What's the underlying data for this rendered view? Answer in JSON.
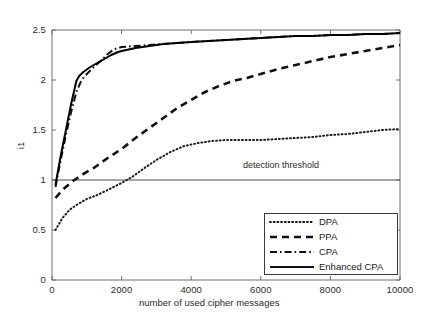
{
  "chart_data": {
    "type": "line",
    "title": "",
    "xlabel": "number of used cipher messages",
    "ylabel": "i1",
    "xlim": [
      0,
      10000
    ],
    "ylim": [
      0,
      2.5
    ],
    "xticks": [
      0,
      2000,
      4000,
      6000,
      8000,
      10000
    ],
    "xtick_labels": [
      "0",
      "2000",
      "4000",
      "6000",
      "8000",
      "10000"
    ],
    "yticks": [
      0,
      0.5,
      1,
      1.5,
      2,
      2.5
    ],
    "ytick_labels": [
      "0",
      "0.5",
      "1",
      "1.5",
      "2",
      "2.5"
    ],
    "grid": false,
    "legend_position": "lower right",
    "annotations": [
      {
        "text": "detection threshold",
        "x": 7600,
        "y": 1.13
      }
    ],
    "threshold_line": {
      "label": "detection threshold",
      "y": 1.0,
      "style": "solid",
      "color": "#4d4d4d"
    },
    "series": [
      {
        "name": "DPA",
        "style": "dotted",
        "color": "#1a1a1a",
        "x": [
          100,
          300,
          500,
          700,
          1000,
          1300,
          1600,
          2000,
          2300,
          2700,
          3000,
          3400,
          3800,
          4200,
          4600,
          5000,
          5500,
          6000,
          6500,
          7000,
          7500,
          8000,
          8500,
          9000,
          9500,
          10000
        ],
        "y": [
          0.5,
          0.62,
          0.7,
          0.75,
          0.81,
          0.85,
          0.9,
          0.97,
          1.03,
          1.13,
          1.2,
          1.28,
          1.34,
          1.37,
          1.39,
          1.4,
          1.4,
          1.4,
          1.41,
          1.42,
          1.43,
          1.45,
          1.46,
          1.48,
          1.5,
          1.51
        ]
      },
      {
        "name": "PPA",
        "style": "dashed",
        "color": "#111111",
        "x": [
          100,
          300,
          600,
          900,
          1200,
          1600,
          2000,
          2400,
          2800,
          3200,
          3600,
          4000,
          4400,
          4800,
          5200,
          5600,
          6000,
          6500,
          7000,
          7500,
          8000,
          8500,
          9000,
          9500,
          10000
        ],
        "y": [
          0.82,
          0.9,
          0.99,
          1.06,
          1.12,
          1.22,
          1.31,
          1.42,
          1.52,
          1.62,
          1.72,
          1.8,
          1.88,
          1.94,
          1.99,
          2.02,
          2.06,
          2.11,
          2.15,
          2.19,
          2.23,
          2.26,
          2.29,
          2.32,
          2.35
        ]
      },
      {
        "name": "CPA",
        "style": "dashdot",
        "color": "#111111",
        "x": [
          100,
          250,
          400,
          550,
          700,
          850,
          1000,
          1200,
          1400,
          1600,
          1800,
          2000,
          2400,
          2800,
          3200,
          3600,
          4000,
          4500,
          5000,
          5500,
          6000,
          6500,
          7000,
          7500,
          8000,
          8500,
          9000,
          9500,
          10000
        ],
        "y": [
          0.93,
          1.2,
          1.45,
          1.68,
          1.88,
          2.0,
          2.06,
          2.13,
          2.19,
          2.26,
          2.31,
          2.33,
          2.34,
          2.35,
          2.36,
          2.37,
          2.38,
          2.39,
          2.4,
          2.41,
          2.42,
          2.43,
          2.44,
          2.44,
          2.45,
          2.45,
          2.46,
          2.46,
          2.47
        ]
      },
      {
        "name": "Enhanced CPA",
        "style": "solid",
        "color": "#000000",
        "x": [
          100,
          250,
          400,
          550,
          700,
          780,
          900,
          1100,
          1300,
          1500,
          1700,
          1900,
          2000,
          2400,
          2800,
          3200,
          3600,
          4000,
          4500,
          5000,
          5500,
          6000,
          6500,
          7000,
          7500,
          8000,
          8500,
          9000,
          9500,
          10000
        ],
        "y": [
          0.95,
          1.24,
          1.5,
          1.76,
          1.99,
          2.04,
          2.08,
          2.13,
          2.17,
          2.21,
          2.25,
          2.28,
          2.29,
          2.32,
          2.34,
          2.36,
          2.37,
          2.38,
          2.39,
          2.4,
          2.41,
          2.42,
          2.43,
          2.44,
          2.44,
          2.45,
          2.45,
          2.46,
          2.46,
          2.47
        ]
      }
    ]
  },
  "legend": {
    "items": [
      {
        "label": "DPA",
        "style": "dotted"
      },
      {
        "label": "PPA",
        "style": "dashed"
      },
      {
        "label": "CPA",
        "style": "dashdot"
      },
      {
        "label": "Enhanced CPA",
        "style": "solid"
      }
    ]
  }
}
